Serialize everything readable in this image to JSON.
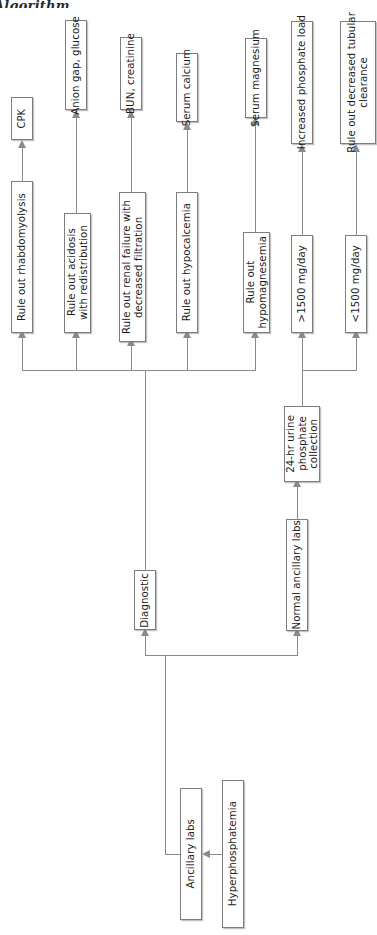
{
  "figure": {
    "caption_partial": "Algorithm",
    "orientation": "rotated-90-ccw",
    "colors": {
      "box_border": "#7d7d7d",
      "line": "#8a8a8a",
      "text": "#1b1b1b",
      "background": "#ffffff"
    }
  },
  "nodes": {
    "root": "Hyperphosphatemia",
    "ancillary_labs": "Ancillary labs",
    "diagnostic": "Diagnostic",
    "normal_ancillary_labs": "Normal ancillary labs",
    "urine_collection": "24-hr urine\nphosphate\ncollection",
    "rule_out_rhabdomyolysis": "Rule out rhabdomyolysis",
    "cpk": "CPK",
    "rule_out_acidosis": "Rule out acidosis\nwith redistribution",
    "anion_gap_glucose": "Anion gap, glucose",
    "rule_out_renal_failure": "Rule out renal failure with\ndecreased filtration",
    "bun_creatinine": "BUN, creatinine",
    "rule_out_hypocalcemia": "Rule out hypocalcemia",
    "serum_calcium": "Serum calcium",
    "rule_out_hypomagnesemia": "Rule out\nhypomagnesemia",
    "serum_magnesium": "Serum magnesium",
    "gt_1500": ">1500 mg/day",
    "increased_phosphate_load": "Increased phosphate load",
    "lt_1500": "<1500 mg/day",
    "rule_out_decreased_tubular": "Rule out decreased tubular\nclearance"
  }
}
